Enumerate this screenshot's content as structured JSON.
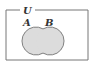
{
  "diagram": {
    "type": "venn",
    "universe_label": "U",
    "sets": [
      {
        "label": "A"
      },
      {
        "label": "B"
      }
    ],
    "shaded_region": "A ∪ B",
    "colors": {
      "fill": "#dcdcdc",
      "stroke": "#555555",
      "frame": "#777777"
    }
  }
}
